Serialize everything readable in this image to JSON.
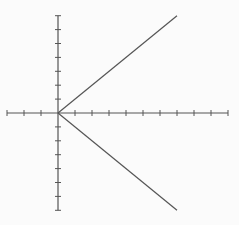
{
  "chart_data": {
    "type": "line",
    "title": "",
    "xlabel": "",
    "ylabel": "",
    "xlim": [
      -3,
      10
    ],
    "ylim": [
      -7,
      7
    ],
    "x_tick_step": 1,
    "y_tick_step": 1,
    "grid": false,
    "legend": null,
    "series": [
      {
        "name": "upper-branch",
        "x": [
          0,
          7
        ],
        "y": [
          0,
          7
        ]
      },
      {
        "name": "lower-branch",
        "x": [
          0,
          7
        ],
        "y": [
          0,
          -7
        ]
      }
    ]
  },
  "style": {
    "background": "#fbfbfb",
    "axis_color": "#555555",
    "line_color": "#555555"
  }
}
